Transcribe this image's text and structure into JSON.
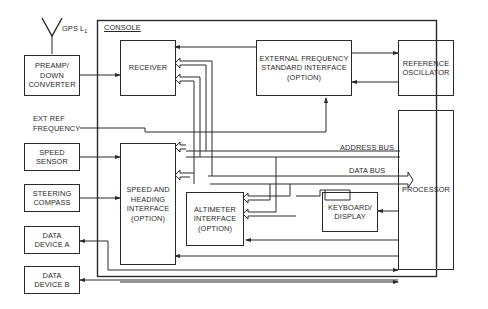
{
  "diagram": {
    "type": "block-diagram",
    "console_label": "CONSOLE",
    "antenna_label": "GPS L",
    "antenna_subscript": "1",
    "blocks": {
      "preamp": "PREAMP/\nDOWN\nCONVERTER",
      "receiver": "RECEIVER",
      "ext_freq_std": "EXTERNAL FREQUENCY\nSTANDARD INTERFACE\n(OPTION)",
      "ref_osc": "REFERENCE\nOSCILLATOR",
      "speed_sensor": "SPEED\nSENSOR",
      "steering_compass": "STEERING\nCOMPASS",
      "speed_heading": "SPEED AND\nHEADING\nINTERFACE\n(OPTION)",
      "altimeter": "ALTIMETER\nINTERFACE\n(OPTION)",
      "keyboard": "KEYBOARD/\nDISPLAY",
      "processor": "PROCESSOR",
      "data_device_a": "DATA\nDEVICE A",
      "data_device_b": "DATA\nDEVICE B"
    },
    "labels": {
      "ext_ref": "EXT REF\nFREQUENCY",
      "address_bus": "ADDRESS BUS",
      "data_bus": "DATA BUS"
    },
    "line_color": "#2a2a2a"
  }
}
